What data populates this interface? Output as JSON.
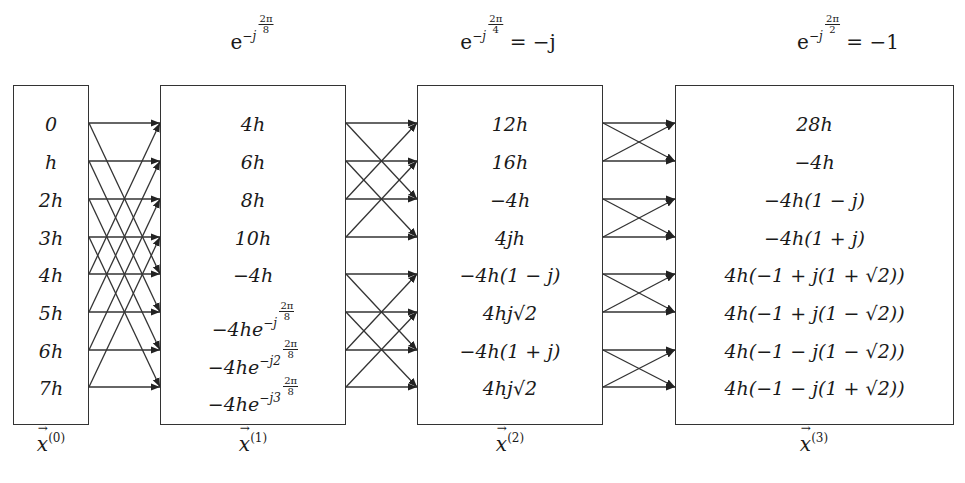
{
  "twiddles": [
    {
      "base": "e",
      "exp_prefix": "−j",
      "frac_num": "2π",
      "frac_den": "8",
      "equals": ""
    },
    {
      "base": "e",
      "exp_prefix": "−j",
      "frac_num": "2π",
      "frac_den": "4",
      "equals": "= −j"
    },
    {
      "base": "e",
      "exp_prefix": "−j",
      "frac_num": "2π",
      "frac_den": "2",
      "equals": "= −1"
    }
  ],
  "stages": [
    {
      "label_base": "x",
      "label_sup": "(0)",
      "values": [
        "0",
        "h",
        "2h",
        "3h",
        "4h",
        "5h",
        "6h",
        "7h"
      ]
    },
    {
      "label_base": "x",
      "label_sup": "(1)",
      "values": [
        "4h",
        "6h",
        "8h",
        "10h",
        "−4h",
        "−4he^{−j 2π/8}",
        "−4he^{−j2 2π/8}",
        "−4he^{−j3 2π/8}"
      ]
    },
    {
      "label_base": "x",
      "label_sup": "(2)",
      "values": [
        "12h",
        "16h",
        "−4h",
        "4jh",
        "−4h(1 − j)",
        "4hj√2",
        "−4h(1 + j)",
        "4hj√2"
      ]
    },
    {
      "label_base": "x",
      "label_sup": "(3)",
      "values": [
        "28h",
        "−4h",
        "−4h(1 − j)",
        "−4h(1 + j)",
        "4h(−1 + j(1 + √2))",
        "4h(−1 + j(1 − √2))",
        "4h(−1 − j(1 − √2))",
        "4h(−1 − j(1 + √2))"
      ]
    }
  ],
  "stage1_exp": [
    {
      "pre": "−4he",
      "exp": "−j",
      "num": "2π",
      "den": "8"
    },
    {
      "pre": "−4he",
      "exp": "−j2",
      "num": "2π",
      "den": "8"
    },
    {
      "pre": "−4he",
      "exp": "−j3",
      "num": "2π",
      "den": "8"
    }
  ],
  "butterfly_spans": [
    4,
    2,
    1
  ],
  "colors": {
    "line": "#333333",
    "text": "#1a1a1a",
    "background": "#ffffff"
  }
}
